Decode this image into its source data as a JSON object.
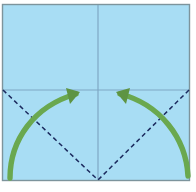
{
  "figure": {
    "kind": "origami-fold-diagram",
    "canvas": {
      "width": 196,
      "height": 192,
      "background": "#ffffff"
    }
  },
  "paper": {
    "name": "square-paper-sheet",
    "fill": "#a8ddf4",
    "border_color": "#7d949c",
    "border_width": 1.4,
    "x": 2.5,
    "y": 4.5,
    "width": 187,
    "height": 176
  },
  "creases": {
    "color": "#7fa8c4",
    "width": 1.2,
    "vertical": {
      "name": "vertical-crease-line",
      "x": 98,
      "y1": 5,
      "y2": 180
    },
    "horizontal": {
      "name": "horizontal-crease-line",
      "y": 90,
      "x1": 3,
      "x2": 189
    }
  },
  "fold_lines": {
    "color": "#1b2a5e",
    "width": 1.5,
    "dash": "4.5,3.2",
    "left": {
      "name": "fold-line-left",
      "x1": 3,
      "y1": 90,
      "x2": 98,
      "y2": 180
    },
    "right": {
      "name": "fold-line-right",
      "x1": 189,
      "y1": 90,
      "x2": 98,
      "y2": 180
    }
  },
  "arrows": {
    "color": "#6aa84f",
    "width": 5.4,
    "head_color": "#5e9443",
    "left": {
      "name": "fold-arrow-left",
      "path": "M 10 178 C 10 140, 34 106, 76 94",
      "head": "80 92 66 88 70 104",
      "label": "fold left corner up to center"
    },
    "right": {
      "name": "fold-arrow-right",
      "path": "M 188 176 C 186 138, 160 104, 120 94",
      "head": "116 92 130 88 126 104",
      "label": "fold right corner up to center"
    }
  },
  "center_point": {
    "name": "paper-center-point",
    "x": 98,
    "y": 90
  }
}
